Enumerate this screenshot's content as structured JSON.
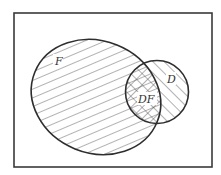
{
  "diagram": {
    "type": "venn",
    "universe": {
      "x": 14,
      "y": 13,
      "width": 198,
      "height": 154,
      "stroke": "#3a3a3a"
    },
    "sets": [
      {
        "id": "F",
        "label": "F",
        "hatch": "backslash",
        "cx": 96,
        "cy": 97,
        "rx": 66,
        "ry": 56,
        "rotation": 22
      },
      {
        "id": "D",
        "label": "D",
        "hatch": "slash",
        "cx": 157,
        "cy": 92,
        "rx": 32,
        "ry": 31,
        "rotation": 0
      }
    ],
    "intersection": {
      "label": "DF",
      "hatch": "cross"
    },
    "labels": {
      "F": "F",
      "D": "D",
      "DF": "DF"
    },
    "colors": {
      "stroke": "#2e2e2e",
      "hatch": "#555555",
      "background": "#ffffff"
    }
  }
}
